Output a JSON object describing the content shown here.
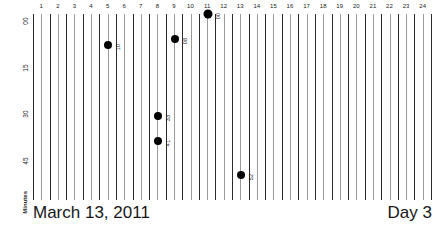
{
  "chart_data": {
    "type": "scatter",
    "title": "March 13, 2011",
    "subtitle": "Day 3",
    "xlabel": "",
    "ylabel": "Minutes",
    "xlim": [
      0,
      24
    ],
    "ylim": [
      0,
      60
    ],
    "grid": true,
    "legend": "none",
    "x_tick_labels": [
      "1",
      "2",
      "3",
      "4",
      "5",
      "6",
      "7",
      "8",
      "9",
      "10",
      "11",
      "12",
      "13",
      "14",
      "15",
      "16",
      "17",
      "18",
      "19",
      "20",
      "21",
      "22",
      "23",
      "24"
    ],
    "y_tick_labels": [
      "00",
      "15",
      "30",
      "45"
    ],
    "y_tick_values": [
      0,
      15,
      30,
      45
    ],
    "points": [
      {
        "hour": 5,
        "minute": 10,
        "label": "10",
        "size": "normal"
      },
      {
        "hour": 9,
        "minute": 8,
        "label": "08",
        "size": "normal"
      },
      {
        "hour": 11,
        "minute": 0,
        "label": "00",
        "size": "big"
      },
      {
        "hour": 8,
        "minute": 33,
        "label": "33",
        "size": "normal"
      },
      {
        "hour": 8,
        "minute": 41,
        "label": "41",
        "size": "normal"
      },
      {
        "hour": 13,
        "minute": 52,
        "label": "52",
        "size": "normal"
      }
    ]
  },
  "axis": {
    "y_label": "Minutes",
    "y_ticks": [
      "00",
      "15",
      "30",
      "45"
    ]
  },
  "footer": {
    "date": "March 13, 2011",
    "day": "Day 3"
  }
}
